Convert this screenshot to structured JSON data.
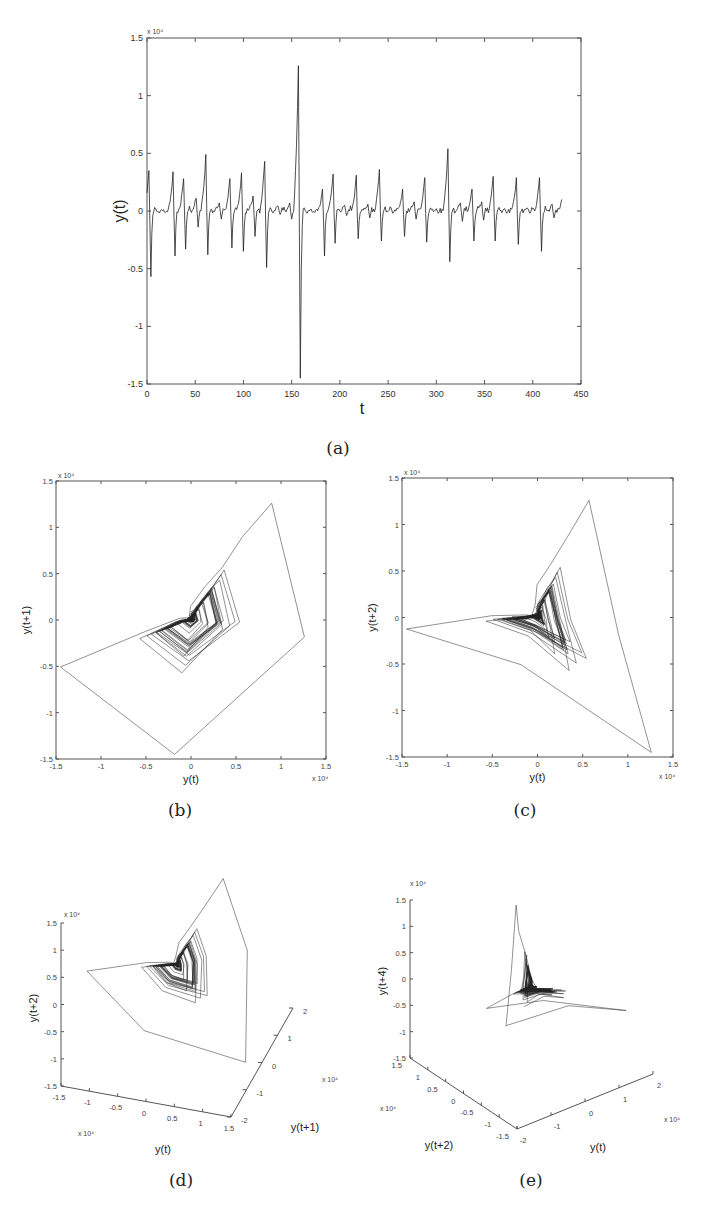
{
  "figure": {
    "captions": [
      "(a)",
      "(b)",
      "(c)",
      "(d)",
      "(e)"
    ],
    "exponent_label": "x 10⁴"
  },
  "chart_data": [
    {
      "id": "a",
      "type": "line",
      "title": "",
      "xlabel": "t",
      "ylabel": "y(t)",
      "xlim": [
        0,
        450
      ],
      "ylim": [
        -15000,
        15000
      ],
      "y_scale_label": "x 10^4",
      "xticks": [
        0,
        50,
        100,
        150,
        200,
        250,
        300,
        350,
        400,
        450
      ],
      "xtick_labels": [
        "0",
        "50",
        "100",
        "150",
        "200",
        "250",
        "300",
        "350",
        "400",
        "450"
      ],
      "yticks": [
        -15000,
        -10000,
        -5000,
        0,
        5000,
        10000,
        15000
      ],
      "ytick_labels": [
        "-1.5",
        "-1",
        "-0.5",
        "0",
        "0.5",
        "1",
        "1.5"
      ],
      "series_description": "ECG-like spike train; each spike = sharp positive peak followed by negative trough, between spikes small bumps near 0",
      "spikes": [
        {
          "t": 2,
          "peak": 3500,
          "trough": -5700
        },
        {
          "t": 27,
          "peak": 3400,
          "trough": -3900
        },
        {
          "t": 38,
          "peak": 2800,
          "trough": -3300
        },
        {
          "t": 51,
          "peak": 1100,
          "trough": -1400
        },
        {
          "t": 61,
          "peak": 4900,
          "trough": -3800
        },
        {
          "t": 75,
          "peak": 700,
          "trough": -700
        },
        {
          "t": 86,
          "peak": 2800,
          "trough": -3200
        },
        {
          "t": 98,
          "peak": 3300,
          "trough": -3500
        },
        {
          "t": 110,
          "peak": 1300,
          "trough": -2200
        },
        {
          "t": 122,
          "peak": 4300,
          "trough": -4900
        },
        {
          "t": 136,
          "peak": 400,
          "trough": -300
        },
        {
          "t": 148,
          "peak": 700,
          "trough": -700
        },
        {
          "t": 157,
          "peak": 12600,
          "trough": -14500
        },
        {
          "t": 182,
          "peak": 1900,
          "trough": -3900
        },
        {
          "t": 193,
          "peak": 3200,
          "trough": -2800
        },
        {
          "t": 205,
          "peak": 500,
          "trough": -400
        },
        {
          "t": 217,
          "peak": 3100,
          "trough": -2400
        },
        {
          "t": 229,
          "peak": 600,
          "trough": -600
        },
        {
          "t": 241,
          "peak": 3600,
          "trough": -2600
        },
        {
          "t": 253,
          "peak": 300,
          "trough": -200
        },
        {
          "t": 265,
          "peak": 1900,
          "trough": -2200
        },
        {
          "t": 277,
          "peak": 800,
          "trough": -700
        },
        {
          "t": 288,
          "peak": 2900,
          "trough": -2700
        },
        {
          "t": 300,
          "peak": 200,
          "trough": -200
        },
        {
          "t": 312,
          "peak": 5400,
          "trough": -4400
        },
        {
          "t": 325,
          "peak": 700,
          "trough": -900
        },
        {
          "t": 337,
          "peak": 1900,
          "trough": -2600
        },
        {
          "t": 347,
          "peak": 800,
          "trough": -800
        },
        {
          "t": 359,
          "peak": 3000,
          "trough": -2600
        },
        {
          "t": 371,
          "peak": 200,
          "trough": -200
        },
        {
          "t": 383,
          "peak": 2900,
          "trough": -2900
        },
        {
          "t": 395,
          "peak": 200,
          "trough": -200
        },
        {
          "t": 407,
          "peak": 2900,
          "trough": -3500
        },
        {
          "t": 420,
          "peak": 600,
          "trough": -600
        }
      ],
      "end_value": {
        "t": 430,
        "y": 1000
      }
    },
    {
      "id": "b",
      "type": "line",
      "subtype": "phase-portrait-2d",
      "xlabel": "y(t)",
      "ylabel": "y(t+1)",
      "delay": 1,
      "xlim": [
        -15000,
        15000
      ],
      "ylim": [
        -15000,
        15000
      ],
      "xticks": [
        -15000,
        -10000,
        -5000,
        0,
        5000,
        10000,
        15000
      ],
      "xtick_labels": [
        "-1.5",
        "-1",
        "-0.5",
        "0",
        "0.5",
        "1",
        "1.5"
      ],
      "yticks": [
        -15000,
        -10000,
        -5000,
        0,
        5000,
        10000,
        15000
      ],
      "ytick_labels": [
        "-1.5",
        "-1",
        "-0.5",
        "0",
        "0.5",
        "1",
        "1.5"
      ],
      "extreme_points": [
        [
          -14500,
          -5700
        ],
        [
          12600,
          -2800
        ],
        [
          -2800,
          -14500
        ],
        [
          6600,
          12600
        ]
      ]
    },
    {
      "id": "c",
      "type": "line",
      "subtype": "phase-portrait-2d",
      "xlabel": "y(t)",
      "ylabel": "y(t+2)",
      "delay": 2,
      "xlim": [
        -15000,
        15000
      ],
      "ylim": [
        -15000,
        15000
      ],
      "xticks": [
        -15000,
        -10000,
        -5000,
        0,
        5000,
        10000,
        15000
      ],
      "xtick_labels": [
        "-1.5",
        "-1",
        "-0.5",
        "0",
        "0.5",
        "1",
        "1.5"
      ],
      "yticks": [
        -15000,
        -10000,
        -5000,
        0,
        5000,
        10000,
        15000
      ],
      "ytick_labels": [
        "-1.5",
        "-1",
        "-0.5",
        "0",
        "0.5",
        "1",
        "1.5"
      ],
      "extreme_points": [
        [
          -14500,
          -2000
        ],
        [
          12600,
          -14500
        ],
        [
          3000,
          12600
        ]
      ]
    },
    {
      "id": "d",
      "type": "line",
      "subtype": "phase-portrait-3d",
      "xlabel": "y(t)",
      "ylabel": "y(t+1)",
      "zlabel": "y(t+2)",
      "xlim": [
        -15000,
        15000
      ],
      "ylim": [
        -20000,
        20000
      ],
      "zlim": [
        -15000,
        15000
      ],
      "xtick_labels": [
        "-1.5",
        "-1",
        "-0.5",
        "0",
        "0.5",
        "1",
        "1.5"
      ],
      "ytick_labels": [
        "-2",
        "-1",
        "0",
        "1",
        "2"
      ],
      "ztick_labels": [
        "-1.5",
        "-1",
        "-0.5",
        "0",
        "0.5",
        "1",
        "1.5"
      ]
    },
    {
      "id": "e",
      "type": "line",
      "subtype": "phase-portrait-3d",
      "xlabel": "y(t)",
      "ylabel": "y(t+2)",
      "zlabel": "y(t+4)",
      "xlim": [
        -20000,
        20000
      ],
      "ylim": [
        -15000,
        15000
      ],
      "zlim": [
        -15000,
        15000
      ],
      "xtick_labels": [
        "-2",
        "-1",
        "0",
        "1",
        "2"
      ],
      "ytick_labels": [
        "-1.5",
        "-1",
        "-0.5",
        "0",
        "0.5",
        "1",
        "1.5"
      ],
      "ztick_labels": [
        "-1.5",
        "-1",
        "-0.5",
        "0",
        "0.5",
        "1",
        "1.5"
      ]
    }
  ]
}
